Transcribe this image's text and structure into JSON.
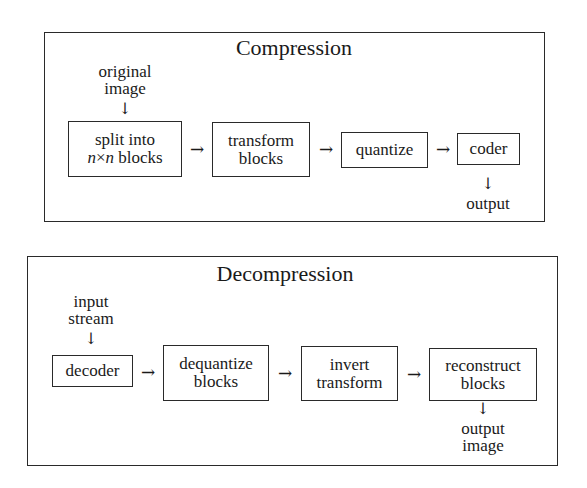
{
  "compression": {
    "title": "Compression",
    "input_label": [
      "original",
      "image"
    ],
    "steps": [
      {
        "line1": "split into",
        "line2_var1": "n",
        "line2_times": "×",
        "line2_var2": "n",
        "line2_rest": " blocks"
      },
      {
        "line1": "transform",
        "line2": "blocks"
      },
      {
        "line1": "quantize"
      },
      {
        "line1": "coder"
      }
    ],
    "output_label": [
      "output"
    ],
    "arrow_h": "→",
    "arrow_v": "↓"
  },
  "decompression": {
    "title": "Decompression",
    "input_label": [
      "input",
      "stream"
    ],
    "steps": [
      {
        "line1": "decoder"
      },
      {
        "line1": "dequantize",
        "line2": "blocks"
      },
      {
        "line1": "invert",
        "line2": "transform"
      },
      {
        "line1": "reconstruct",
        "line2": "blocks"
      }
    ],
    "output_label": [
      "output",
      "image"
    ],
    "arrow_h": "→",
    "arrow_v": "↓"
  }
}
